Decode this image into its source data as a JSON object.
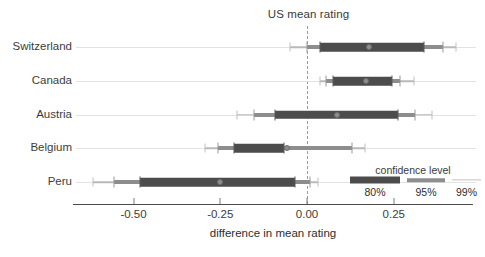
{
  "chart_data": {
    "type": "bar",
    "title": "US mean rating",
    "xlabel": "difference in mean rating",
    "ylabel": "",
    "grid": true,
    "xlim": [
      -0.67,
      0.47
    ],
    "xticks": [
      -0.5,
      -0.25,
      0.0,
      0.25
    ],
    "xticklabels": [
      "-0.50",
      "-0.25",
      "0.00",
      "0.25"
    ],
    "reference_line": {
      "value": 0.0,
      "label": "US mean rating",
      "style": "dashed"
    },
    "categories": [
      "Switzerland",
      "Canada",
      "Austria",
      "Belgium",
      "Peru"
    ],
    "values": [
      0.18,
      0.17,
      0.09,
      -0.06,
      -0.25
    ],
    "intervals": [
      {
        "category": "Switzerland",
        "estimate": 0.18,
        "ci80": [
          0.037,
          0.336
        ],
        "ci95": [
          0.0,
          0.391
        ],
        "ci99": [
          -0.049,
          0.428
        ]
      },
      {
        "category": "Canada",
        "estimate": 0.17,
        "ci80": [
          0.075,
          0.245
        ],
        "ci95": [
          0.055,
          0.267
        ],
        "ci99": [
          0.037,
          0.307
        ]
      },
      {
        "category": "Austria",
        "estimate": 0.086,
        "ci80": [
          -0.092,
          0.261
        ],
        "ci95": [
          -0.152,
          0.31
        ],
        "ci99": [
          -0.201,
          0.359
        ]
      },
      {
        "category": "Belgium",
        "estimate": -0.057,
        "ci80": [
          -0.21,
          -0.066
        ],
        "ci95": [
          -0.256,
          0.129
        ],
        "ci99": [
          -0.293,
          0.166
        ]
      },
      {
        "category": "Peru",
        "estimate": -0.25,
        "ci80": [
          -0.48,
          -0.034
        ],
        "ci95": [
          -0.557,
          0.009
        ],
        "ci99": [
          -0.617,
          0.032
        ]
      }
    ],
    "legend": {
      "title": "confidence level",
      "position": "bottom-right",
      "entries": [
        {
          "label": "80%",
          "color": "#4c4c4c"
        },
        {
          "label": "95%",
          "color": "#8d8d8d"
        },
        {
          "label": "99%",
          "color": "#c2c2c2"
        }
      ]
    }
  },
  "colors": {
    "ci80": "#4c4c4c",
    "ci95": "#8d8d8d",
    "ci99": "#c2c2c2",
    "point": "#8e8e8e",
    "grid": "#e2e2e2",
    "axis": "#4a4a4a",
    "reference": "#9a9a9a",
    "text": "#3c3c3c",
    "background": "#ffffff"
  }
}
